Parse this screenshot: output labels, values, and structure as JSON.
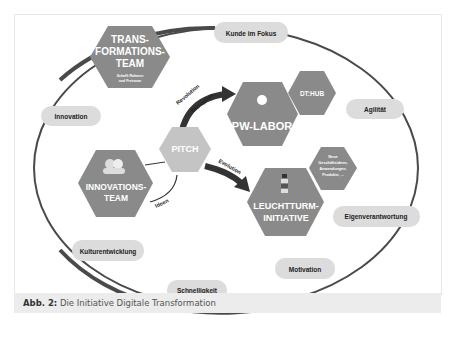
{
  "figure": {
    "caption_label": "Abb. 2:",
    "caption_text": " Die Initiative Digitale Transformation"
  },
  "hexagons": {
    "transformations_team": {
      "line1": "TRANS-",
      "line2": "FORMATIONS-",
      "line3": "TEAM",
      "sub1": "Schafft Rahmen",
      "sub2": "und Freiraum"
    },
    "pw_labor": {
      "label": "PW-LABOR"
    },
    "dt_hub": {
      "label": "DT:HUB"
    },
    "pitch": {
      "label": "PITCH"
    },
    "innovations_team": {
      "line1": "INNOVATIONS-",
      "line2": "TEAM"
    },
    "leuchtturm": {
      "line1": "LEUCHTTURM-",
      "line2": "INITIATIVE"
    },
    "neue": {
      "line1": "Neue",
      "line2": "Geschäftsideen,",
      "line3": "Anwendungen,",
      "line4": "Produkte, ..."
    }
  },
  "arrows": {
    "revolution": "Revolution",
    "disruption": "Disruption",
    "evolution": "Evolution",
    "ideen": "Ideen"
  },
  "values": {
    "kunde": "Kunde im Fokus",
    "agilitaet": "Agilität",
    "eigenverantwortung": "Eigenverantwortung",
    "motivation": "Motivation",
    "schnelligkeit": "Schnelligkeit",
    "kulturentwicklung": "Kulturentwicklung",
    "innovation": "Innovation"
  },
  "colors": {
    "hex_dark": "#8a8a8a",
    "hex_light": "#c4c4c4",
    "pill": "#dcdcdc",
    "ring": "#4a4a4a"
  }
}
